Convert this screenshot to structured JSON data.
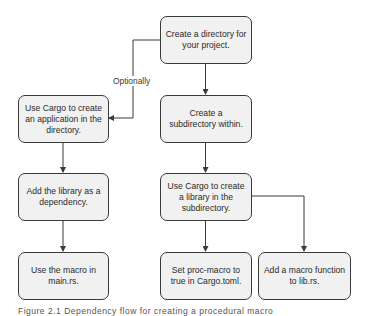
{
  "diagram": {
    "nodes": [
      {
        "id": "create-directory",
        "text": "Create a directory for your project."
      },
      {
        "id": "cargo-application",
        "text": "Use Cargo to create an application in the directory."
      },
      {
        "id": "create-subdirectory",
        "text": "Create a subdirectory within."
      },
      {
        "id": "add-library-dependency",
        "text": "Add the library as a dependency."
      },
      {
        "id": "cargo-library",
        "text": "Use Cargo to create a library in the subdirectory."
      },
      {
        "id": "use-macro",
        "text": "Use the macro in main.rs."
      },
      {
        "id": "set-proc-macro",
        "text": "Set proc-macro to true in Cargo.toml."
      },
      {
        "id": "add-macro-function",
        "text": "Add a macro function to lib.rs."
      }
    ],
    "edges": [
      {
        "from": "create-directory",
        "to": "cargo-application",
        "label": "Optionally"
      },
      {
        "from": "create-directory",
        "to": "create-subdirectory",
        "label": ""
      },
      {
        "from": "cargo-application",
        "to": "add-library-dependency",
        "label": ""
      },
      {
        "from": "create-subdirectory",
        "to": "cargo-library",
        "label": ""
      },
      {
        "from": "add-library-dependency",
        "to": "use-macro",
        "label": ""
      },
      {
        "from": "cargo-library",
        "to": "set-proc-macro",
        "label": ""
      },
      {
        "from": "cargo-library",
        "to": "add-macro-function",
        "label": ""
      }
    ],
    "edge_label_optionally": "Optionally",
    "caption": "Figure 2.1  Dependency flow for creating a procedural macro"
  },
  "colors": {
    "box_fill": "#f1f1f1",
    "box_border": "#3a3a3a",
    "line": "#3a3a3a"
  }
}
